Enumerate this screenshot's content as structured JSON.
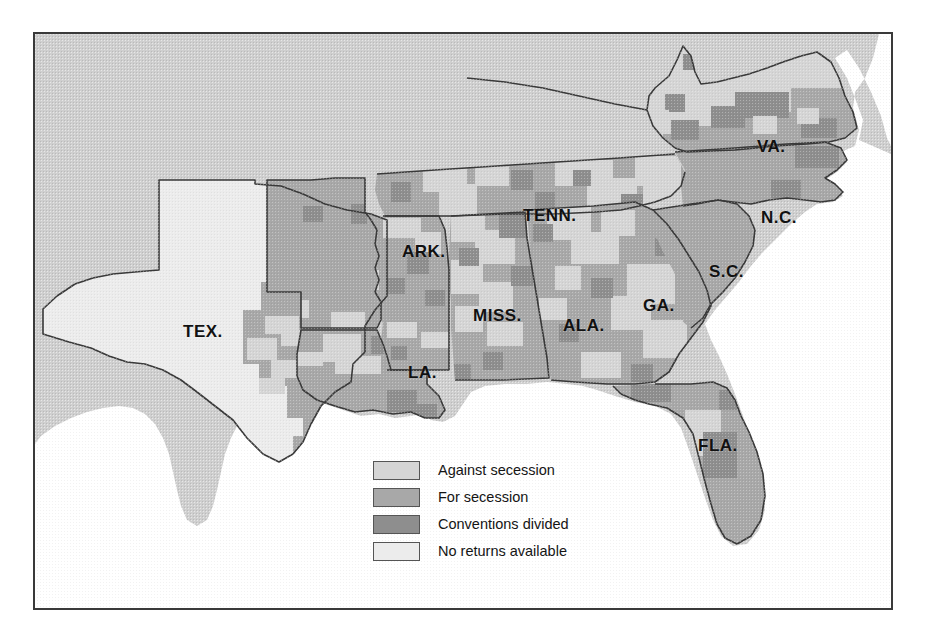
{
  "figure": {
    "kind": "thematic-choropleth-map",
    "region": "Southern United States"
  },
  "colors": {
    "against_secession": "#d5d5d5",
    "for_secession": "#a8a8a8",
    "conventions_divided": "#8e8e8e",
    "no_returns_available": "#ececec",
    "non_confederate_land": "#cfcfcf",
    "ocean": "#ffffff",
    "border_line": "#3a3a3a",
    "frame": "#3a3a3a",
    "label_text": "#111111"
  },
  "legend": {
    "items": [
      {
        "label": "Against secession",
        "swatch": "against_secession",
        "color": "#d5d5d5"
      },
      {
        "label": "For secession",
        "swatch": "for_secession",
        "color": "#a8a8a8"
      },
      {
        "label": "Conventions divided",
        "swatch": "conventions_divided",
        "color": "#8e8e8e"
      },
      {
        "label": "No returns available",
        "swatch": "no_returns_available",
        "color": "#ececec"
      }
    ]
  },
  "states": [
    {
      "abbr": "TEX.",
      "x": 148,
      "y": 288,
      "name": "Texas"
    },
    {
      "abbr": "ARK.",
      "x": 367,
      "y": 208,
      "name": "Arkansas"
    },
    {
      "abbr": "LA.",
      "x": 373,
      "y": 329,
      "name": "Louisiana"
    },
    {
      "abbr": "MISS.",
      "x": 438,
      "y": 272,
      "name": "Mississippi"
    },
    {
      "abbr": "ALA.",
      "x": 528,
      "y": 282,
      "name": "Alabama"
    },
    {
      "abbr": "TENN.",
      "x": 488,
      "y": 172,
      "name": "Tennessee"
    },
    {
      "abbr": "GA.",
      "x": 608,
      "y": 262,
      "name": "Georgia"
    },
    {
      "abbr": "FLA.",
      "x": 663,
      "y": 402,
      "name": "Florida"
    },
    {
      "abbr": "S.C.",
      "x": 674,
      "y": 228,
      "name": "South Carolina"
    },
    {
      "abbr": "N.C.",
      "x": 726,
      "y": 174,
      "name": "North Carolina"
    },
    {
      "abbr": "VA.",
      "x": 722,
      "y": 103,
      "name": "Virginia"
    }
  ]
}
